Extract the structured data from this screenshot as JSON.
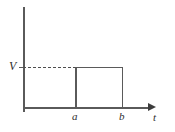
{
  "figure": {
    "title": ""
  },
  "axes": {
    "y_label": "V",
    "x_label": "t",
    "x_arrow": "arrow-right"
  },
  "ticks": {
    "y": [
      {
        "label": "V",
        "value": "V"
      }
    ],
    "x": [
      {
        "label": "a",
        "value": "a"
      },
      {
        "label": "b",
        "value": "b"
      }
    ]
  },
  "chart_data": {
    "type": "line",
    "title": "",
    "xlabel": "t",
    "ylabel": "V",
    "x_tick_labels": [
      "a",
      "b"
    ],
    "y_tick_labels": [
      "V"
    ],
    "grid": false,
    "legend": null,
    "series": [
      {
        "name": "voltage pulse",
        "style": "solid",
        "points": [
          {
            "x": "a",
            "y": 0
          },
          {
            "x": "a",
            "y": "V"
          },
          {
            "x": "b",
            "y": "V"
          },
          {
            "x": "b",
            "y": 0
          }
        ]
      },
      {
        "name": "level guide",
        "style": "dashed",
        "points": [
          {
            "x": "0",
            "y": "V"
          },
          {
            "x": "a",
            "y": "V"
          }
        ]
      }
    ]
  },
  "colors": {
    "line": "#5a5a5a",
    "dashed_line": "#4e4e4e",
    "arrow": "#3c3c3c",
    "text": "#2e2e2e",
    "background": "#ffffff"
  }
}
